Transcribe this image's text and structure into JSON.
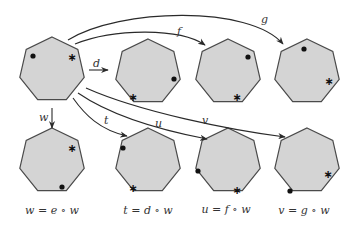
{
  "diagram": {
    "type": "group-action-heptagon",
    "markers": {
      "dot": "filled-circle",
      "star": "asterisk"
    },
    "source": {
      "id": "src",
      "dot_vertex_angle": -130,
      "star_vertex_angle": -40
    },
    "top_row": [
      {
        "id": "d",
        "arrow_label": "d"
      },
      {
        "id": "f",
        "arrow_label": "f"
      },
      {
        "id": "g",
        "arrow_label": "g"
      }
    ],
    "bottom_row": [
      {
        "id": "w",
        "arrow_label": "w",
        "caption": "w = e ∘ w"
      },
      {
        "id": "t",
        "arrow_label": "t",
        "caption": "t = d ∘ w"
      },
      {
        "id": "u",
        "arrow_label": "u",
        "caption": "u = f ∘ w"
      },
      {
        "id": "v",
        "arrow_label": "v",
        "caption": "v = g ∘ w"
      }
    ],
    "colors": {
      "fill": "#d4d4d4",
      "stroke": "#4a4a4a",
      "arrow": "#2a2a2a"
    }
  }
}
